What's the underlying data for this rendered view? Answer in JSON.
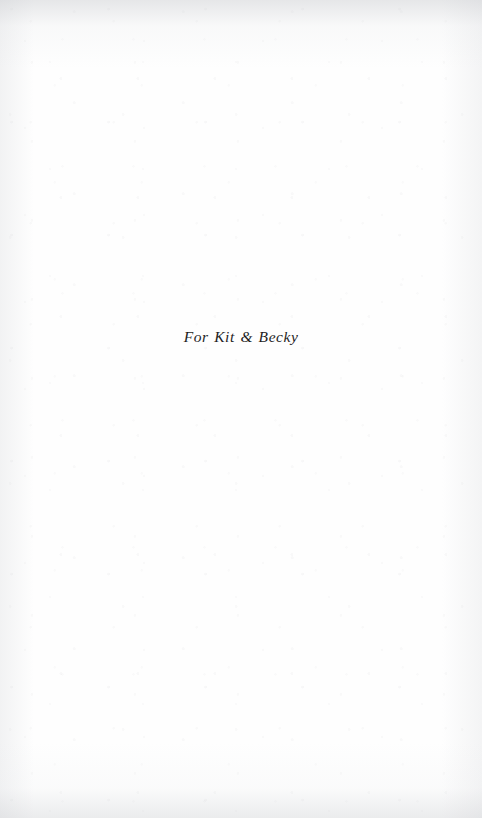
{
  "page": {
    "kind": "book-dedication-page",
    "width": 482,
    "height": 818,
    "background_color": "#fefefe",
    "paper_tint": "#fdfdfd",
    "edge_shadow_color": "#c6c8cc"
  },
  "dedication": {
    "text": "For Kit & Becky",
    "style": "italic-serif",
    "color": "#1e1e1e",
    "alignment": "center",
    "font_size_px": 15.5
  }
}
